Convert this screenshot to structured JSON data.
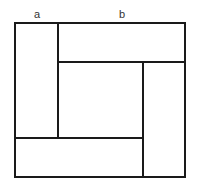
{
  "diagram": {
    "type": "square-tiling",
    "labels": {
      "a": "a",
      "b": "b"
    },
    "colors": {
      "stroke": "#1a1a1a",
      "background": "#ffffff"
    },
    "outer_square": {
      "x": 15,
      "y": 23,
      "w": 170,
      "h": 154
    },
    "segments": [
      {
        "name": "left-divider",
        "x1": 58,
        "y1": 23,
        "x2": 58,
        "y2": 138
      },
      {
        "name": "top-divider",
        "x1": 58,
        "y1": 62,
        "x2": 185,
        "y2": 62
      },
      {
        "name": "right-divider",
        "x1": 143,
        "y1": 62,
        "x2": 143,
        "y2": 177
      },
      {
        "name": "bottom-divider",
        "x1": 15,
        "y1": 138,
        "x2": 143,
        "y2": 138
      }
    ],
    "regions": [
      {
        "name": "left-rectangle"
      },
      {
        "name": "top-rectangle"
      },
      {
        "name": "right-rectangle"
      },
      {
        "name": "bottom-rectangle"
      },
      {
        "name": "center-square"
      }
    ]
  }
}
